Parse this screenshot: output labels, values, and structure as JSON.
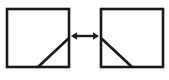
{
  "figure": {
    "name": "mirror-symmetry-diagram",
    "background_color": "#ffffff",
    "stroke_color": "#1a1a1a",
    "canvas": {
      "width": 169,
      "height": 80
    },
    "shapes": {
      "left_square": {
        "label": "left-square",
        "x": 7,
        "y": 9,
        "width": 62,
        "height": 58,
        "stroke_width": 2.6,
        "diagonal": {
          "label": "left-square-diagonal",
          "x1": 38,
          "y1": 67,
          "x2": 69,
          "y2": 38,
          "stroke_width": 2.6,
          "orientation": "rises-left-to-right"
        }
      },
      "right_square": {
        "label": "right-square",
        "x": 101,
        "y": 9,
        "width": 62,
        "height": 58,
        "stroke_width": 2.6,
        "diagonal": {
          "label": "right-square-diagonal",
          "x1": 101,
          "y1": 38,
          "x2": 132,
          "y2": 67,
          "stroke_width": 2.6,
          "orientation": "falls-left-to-right"
        }
      },
      "arrow": {
        "label": "double-headed-arrow",
        "shaft_x1": 77,
        "shaft_x2": 93,
        "shaft_y": 36,
        "shaft_width": 2.4,
        "head_size": 6,
        "left_tip_x": 71,
        "right_tip_x": 99,
        "direction": "bidirectional"
      }
    }
  },
  "chart_data": {
    "type": "diagram",
    "title": "",
    "elements": [
      {
        "id": "left-square",
        "kind": "square",
        "x": 7,
        "y": 9,
        "w": 62,
        "h": 58
      },
      {
        "id": "left-diagonal",
        "kind": "line",
        "from": [
          38,
          67
        ],
        "to": [
          69,
          38
        ]
      },
      {
        "id": "arrow",
        "kind": "double-arrow",
        "from": [
          71,
          36
        ],
        "to": [
          99,
          36
        ]
      },
      {
        "id": "right-square",
        "kind": "square",
        "x": 101,
        "y": 9,
        "w": 62,
        "h": 58
      },
      {
        "id": "right-diagonal",
        "kind": "line",
        "from": [
          101,
          38
        ],
        "to": [
          132,
          67
        ]
      }
    ]
  }
}
